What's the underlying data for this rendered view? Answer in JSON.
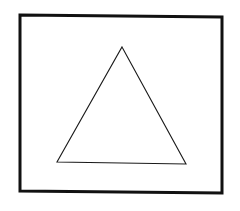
{
  "diagram": {
    "background": "#ffffff",
    "shapes": [
      {
        "id": "outer-rectangle",
        "type": "polygon",
        "points": [
          [
            20,
            15
          ],
          [
            222,
            17
          ],
          [
            222,
            193
          ],
          [
            20,
            191
          ]
        ],
        "stroke": "#111111",
        "stroke_width": 3,
        "fill": "none"
      },
      {
        "id": "inner-triangle",
        "type": "polygon",
        "points": [
          [
            122,
            47
          ],
          [
            186,
            164
          ],
          [
            57,
            162
          ]
        ],
        "stroke": "#1a1a1a",
        "stroke_width": 1.1,
        "fill": "none"
      }
    ]
  }
}
